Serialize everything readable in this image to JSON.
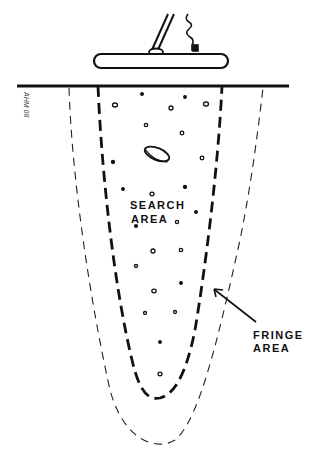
{
  "diagram": {
    "labels": {
      "search_area_line1": "SEARCH",
      "search_area_line2": "AREA",
      "fringe_area_line1": "FRINGE",
      "fringe_area_line2": "AREA",
      "signature": "AHM 08"
    },
    "colors": {
      "ink": "#111111",
      "background": "#ffffff"
    },
    "elements": {
      "search_coil": "metal detector search coil with shaft and coiled cable",
      "ground_line": "ground surface line",
      "search_area_boundary": "heavy dashed inner parabola",
      "fringe_area_boundary": "light dashed outer parabola",
      "buried_coin": "coin / disc target",
      "soil_particles": "scattered pebbles in soil",
      "fringe_pointer": "arrow pointing to search area edge"
    }
  }
}
